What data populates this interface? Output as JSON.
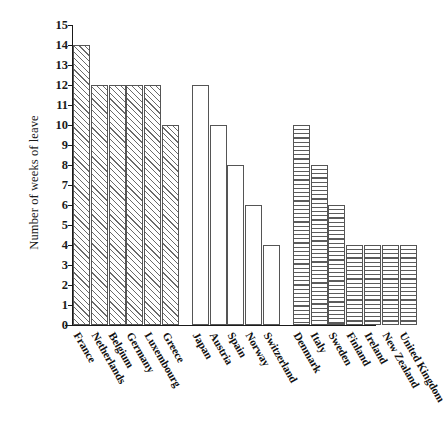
{
  "chart_data": {
    "type": "bar",
    "title": "",
    "xlabel": "",
    "ylabel": "Number of weeks of leave",
    "ylim": [
      0,
      15
    ],
    "ytick_labels": [
      "0",
      "1",
      "2",
      "3",
      "4",
      "5",
      "6",
      "7",
      "8",
      "9",
      "10",
      "11",
      "12",
      "13",
      "14",
      "15"
    ],
    "ytick_values": [
      0,
      1,
      2,
      3,
      4,
      5,
      6,
      7,
      8,
      9,
      10,
      11,
      12,
      13,
      14,
      15
    ],
    "grid": false,
    "legend": "none",
    "categories": [
      "France",
      "Netherlands",
      "Belgium",
      "Germany",
      "Luxembourg",
      "Greece",
      "Japan",
      "Austria",
      "Spain",
      "Norway",
      "Switzerland",
      "Denmark",
      "Italy",
      "Sweden",
      "Finland",
      "Ireland",
      "New Zealand",
      "United Kingdom"
    ],
    "values": [
      14,
      12,
      12,
      12,
      12,
      10,
      12,
      10,
      8,
      6,
      4,
      10,
      8,
      6,
      4,
      4,
      4,
      4
    ],
    "groups": [
      {
        "name": "group-1",
        "fill": "diagonal-hatch",
        "categories": [
          "France",
          "Netherlands",
          "Belgium",
          "Germany",
          "Luxembourg",
          "Greece"
        ],
        "values": [
          14,
          12,
          12,
          12,
          12,
          10
        ]
      },
      {
        "name": "group-2",
        "fill": "empty",
        "categories": [
          "Japan",
          "Austria",
          "Spain",
          "Norway",
          "Switzerland"
        ],
        "values": [
          12,
          10,
          8,
          6,
          4
        ]
      },
      {
        "name": "group-3",
        "fill": "horizontal-hatch",
        "categories": [
          "Denmark",
          "Italy",
          "Sweden",
          "Finland",
          "Ireland",
          "New Zealand",
          "United Kingdom"
        ],
        "values": [
          10,
          8,
          6,
          4,
          4,
          4,
          4
        ]
      }
    ],
    "bars": [
      {
        "label": "France",
        "value": 14,
        "group": 1,
        "fill": "diagonal-hatch"
      },
      {
        "label": "Netherlands",
        "value": 12,
        "group": 1,
        "fill": "diagonal-hatch"
      },
      {
        "label": "Belgium",
        "value": 12,
        "group": 1,
        "fill": "diagonal-hatch"
      },
      {
        "label": "Germany",
        "value": 12,
        "group": 1,
        "fill": "diagonal-hatch"
      },
      {
        "label": "Luxembourg",
        "value": 12,
        "group": 1,
        "fill": "diagonal-hatch"
      },
      {
        "label": "Greece",
        "value": 10,
        "group": 1,
        "fill": "diagonal-hatch"
      },
      {
        "label": "Japan",
        "value": 12,
        "group": 2,
        "fill": "empty"
      },
      {
        "label": "Austria",
        "value": 10,
        "group": 2,
        "fill": "empty"
      },
      {
        "label": "Spain",
        "value": 8,
        "group": 2,
        "fill": "empty"
      },
      {
        "label": "Norway",
        "value": 6,
        "group": 2,
        "fill": "empty"
      },
      {
        "label": "Switzerland",
        "value": 4,
        "group": 2,
        "fill": "empty"
      },
      {
        "label": "Denmark",
        "value": 10,
        "group": 3,
        "fill": "horizontal-hatch"
      },
      {
        "label": "Italy",
        "value": 8,
        "group": 3,
        "fill": "horizontal-hatch"
      },
      {
        "label": "Sweden",
        "value": 6,
        "group": 3,
        "fill": "horizontal-hatch"
      },
      {
        "label": "Finland",
        "value": 4,
        "group": 3,
        "fill": "horizontal-hatch"
      },
      {
        "label": "Ireland",
        "value": 4,
        "group": 3,
        "fill": "horizontal-hatch"
      },
      {
        "label": "New Zealand",
        "value": 4,
        "group": 3,
        "fill": "horizontal-hatch"
      },
      {
        "label": "United Kingdom",
        "value": 4,
        "group": 3,
        "fill": "horizontal-hatch"
      }
    ],
    "colors": {
      "axis": "#1a1a1a",
      "bar_border": "#555555",
      "bar_fill": "#ffffff",
      "hatch": "#5c5c5c",
      "background": "#ffffff"
    }
  },
  "layout": {
    "plot_left": 73,
    "plot_baseline": 325,
    "plot_top": 25,
    "bar_width": 17,
    "bar_gap": 0.8,
    "group_gap": 12,
    "px_per_unit": 20
  }
}
